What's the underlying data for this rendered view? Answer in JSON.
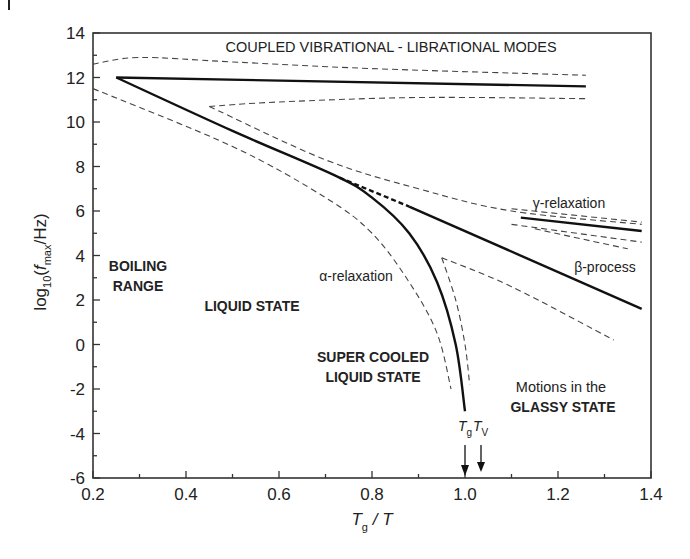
{
  "chart_data": {
    "type": "line",
    "title": "",
    "xlabel": "Tg / T",
    "ylabel": "log10(fmax/Hz)",
    "xlim": [
      0.2,
      1.4
    ],
    "ylim": [
      -6,
      14
    ],
    "x_ticks": [
      "0.2",
      "0.4",
      "0.6",
      "0.8",
      "1.0",
      "1.2",
      "1.4"
    ],
    "y_ticks": [
      "14",
      "12",
      "10",
      "8",
      "6",
      "4",
      "2",
      "0",
      "-2",
      "-4",
      "-6"
    ],
    "grid": false,
    "legend": "none",
    "series": [
      {
        "name": "coupled vibrational-librational modes",
        "style": "solid",
        "points": [
          [
            0.25,
            12.0
          ],
          [
            1.26,
            11.6
          ]
        ]
      },
      {
        "name": "vibrational upper bound",
        "style": "dashed",
        "points": [
          [
            0.2,
            12.6
          ],
          [
            0.3,
            12.9
          ],
          [
            0.5,
            12.7
          ],
          [
            0.8,
            12.4
          ],
          [
            1.26,
            12.1
          ]
        ]
      },
      {
        "name": "vibrational lower bound",
        "style": "dashed",
        "points": [
          [
            0.45,
            10.7
          ],
          [
            0.6,
            10.9
          ],
          [
            0.9,
            11.1
          ],
          [
            1.26,
            11.05
          ]
        ]
      },
      {
        "name": "alpha-relaxation",
        "style": "solid",
        "points": [
          [
            0.25,
            12.0
          ],
          [
            0.5,
            9.6
          ],
          [
            0.72,
            7.6
          ],
          [
            0.8,
            6.6
          ],
          [
            0.88,
            5.0
          ],
          [
            0.94,
            2.8
          ],
          [
            0.98,
            0.0
          ],
          [
            1.0,
            -3.0
          ]
        ]
      },
      {
        "name": "alpha-relaxation outer bound",
        "style": "dashed",
        "points": [
          [
            0.2,
            11.5
          ],
          [
            0.5,
            8.9
          ],
          [
            0.7,
            6.6
          ],
          [
            0.8,
            5.0
          ],
          [
            0.88,
            2.8
          ],
          [
            0.94,
            0.5
          ],
          [
            0.97,
            -2.0
          ]
        ]
      },
      {
        "name": "alpha-relaxation inner bound",
        "style": "dashed",
        "points": [
          [
            0.95,
            3.9
          ],
          [
            0.98,
            2.0
          ],
          [
            1.0,
            0.0
          ],
          [
            1.01,
            -1.8
          ]
        ]
      },
      {
        "name": "beta-process extension",
        "style": "dashed-bold",
        "points": [
          [
            0.73,
            7.5
          ],
          [
            0.88,
            6.2
          ]
        ]
      },
      {
        "name": "beta-process",
        "style": "solid",
        "points": [
          [
            0.88,
            6.2
          ],
          [
            1.38,
            1.6
          ]
        ]
      },
      {
        "name": "beta-process upper bound",
        "style": "dashed",
        "points": [
          [
            0.45,
            10.7
          ],
          [
            0.7,
            8.3
          ],
          [
            0.9,
            7.0
          ],
          [
            1.1,
            6.0
          ],
          [
            1.38,
            5.4
          ]
        ]
      },
      {
        "name": "beta-process lower bound",
        "style": "dashed",
        "points": [
          [
            0.95,
            3.9
          ],
          [
            1.1,
            2.6
          ],
          [
            1.32,
            0.2
          ]
        ]
      },
      {
        "name": "gamma-relaxation",
        "style": "solid",
        "points": [
          [
            1.12,
            5.7
          ],
          [
            1.38,
            5.1
          ]
        ]
      },
      {
        "name": "gamma-relaxation upper bound",
        "style": "dashed",
        "points": [
          [
            1.1,
            6.1
          ],
          [
            1.38,
            5.5
          ]
        ]
      },
      {
        "name": "gamma-relaxation lower bound",
        "style": "dashed",
        "points": [
          [
            1.1,
            5.4
          ],
          [
            1.38,
            4.6
          ]
        ]
      },
      {
        "name": "gamma-relaxation lower bound 2",
        "style": "dashed",
        "points": [
          [
            1.15,
            5.2
          ],
          [
            1.35,
            4.3
          ]
        ]
      }
    ],
    "annotations": [
      {
        "text": "COUPLED VIBRATIONAL - LIBRATIONAL MODES",
        "x": 0.78,
        "y": 13.2
      },
      {
        "text": "γ-relaxation",
        "x": 1.25,
        "y": 6.5
      },
      {
        "text": "β-process",
        "x": 1.3,
        "y": 3.6
      },
      {
        "text": "α-relaxation",
        "x": 0.72,
        "y": 2.4
      },
      {
        "text": "BOILING",
        "x": 0.29,
        "y": 3.6
      },
      {
        "text": "RANGE",
        "x": 0.29,
        "y": 2.3
      },
      {
        "text": "LIQUID STATE",
        "x": 0.55,
        "y": 1.9
      },
      {
        "text": "SUPER COOLED",
        "x": 0.84,
        "y": -1.0
      },
      {
        "text": "LIQUID STATE",
        "x": 0.84,
        "y": -2.4
      },
      {
        "text": "Motions in the",
        "x": 1.15,
        "y": -2.6
      },
      {
        "text": "GLASSY STATE",
        "x": 1.15,
        "y": -3.9
      },
      {
        "text": "Tg",
        "x": 1.0,
        "y": -4.4,
        "arrow_to": -6
      },
      {
        "text": "Tv",
        "x": 1.035,
        "y": -4.4,
        "arrow_to": -6
      }
    ]
  },
  "labels": {
    "title": "COUPLED VIBRATIONAL - LIBRATIONAL MODES",
    "gamma": "γ-relaxation",
    "beta": "β-process",
    "alpha": "α-relaxation",
    "boiling": "BOILING",
    "range": "RANGE",
    "liquid": "LIQUID STATE",
    "supercooled1": "SUPER COOLED",
    "supercooled2": "LIQUID STATE",
    "glassy1": "Motions in the",
    "glassy2": "GLASSY STATE",
    "tg_main": "T",
    "tg_sub": "g",
    "tv_main": "T",
    "tv_sub": "V",
    "xlabel_main": "T",
    "xlabel_sub": "g",
    "xlabel_rest": " / T",
    "ylabel_pre": "log",
    "ylabel_sub10": "10",
    "ylabel_mid": "(",
    "ylabel_f": "f",
    "ylabel_max": "max",
    "ylabel_post": "/Hz)"
  }
}
